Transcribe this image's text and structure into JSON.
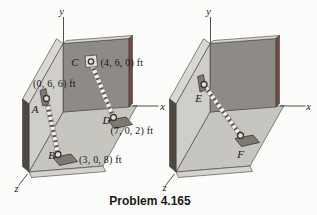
{
  "caption": "Problem 4.165",
  "colors": {
    "back_wall": "#8e8b86",
    "side_wall": "#cfceca",
    "floor": "#c6c5c0",
    "floor_front": "#d4d3ce",
    "top_edge": "#d9d8d3",
    "left_edge_dark": "#4e4842",
    "right_edge_maroon": "#6e4c40",
    "cable_light": "#f2f1ec",
    "cable_dark": "#5f5b54",
    "anchor_metal": "#7d7872",
    "plate_light": "#e0ded8"
  },
  "left_diagram": {
    "axes": {
      "x": "x",
      "y": "y",
      "z": "z"
    },
    "points": {
      "A": {
        "label": "A",
        "coords": "(0, 6, 6) ft"
      },
      "B": {
        "label": "B",
        "coords": "(3, 0, 8) ft"
      },
      "C": {
        "label": "C",
        "coords": "(4, 6, 0) ft"
      },
      "D": {
        "label": "D",
        "coords": "(7, 0, 2) ft"
      }
    }
  },
  "right_diagram": {
    "axes": {
      "x": "x",
      "y": "y",
      "z": "z"
    },
    "points": {
      "E": {
        "label": "E"
      },
      "F": {
        "label": "F"
      }
    }
  }
}
